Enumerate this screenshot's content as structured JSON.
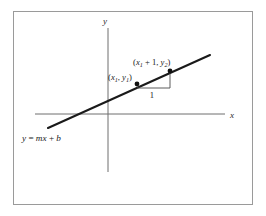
{
  "figure": {
    "background_color": "#ffffff",
    "border_color": "#9a9a9a",
    "ink_color": "#1a1a1a",
    "axis_color": "#6e6e6e"
  },
  "frame": {
    "x": 13,
    "y": 11,
    "width": 240,
    "height": 194
  },
  "axes": {
    "x_axis": {
      "label": "x",
      "x1": 35,
      "y1": 114,
      "x2": 225,
      "y2": 114
    },
    "y_axis": {
      "label": "y",
      "x1": 108,
      "y1": 28,
      "x2": 108,
      "y2": 172
    },
    "x_label_pos": {
      "x": 232,
      "y": 117
    },
    "y_label_pos": {
      "x": 105,
      "y": 24
    }
  },
  "line": {
    "equation_label": "y = mx + b",
    "equation_parts": {
      "y": "y",
      "equals": " = ",
      "m": "m",
      "x": "x",
      "plus": " + ",
      "b": "b"
    },
    "x1": 48,
    "y1": 128,
    "x2": 210,
    "y2": 55,
    "equation_pos": {
      "x": 22,
      "y": 140
    }
  },
  "points": [
    {
      "name": "point-x1-y1",
      "label": "(x₁, y₁)",
      "label_parts": {
        "open": "(",
        "x": "x",
        "xsub": "1",
        "comma": ", ",
        "y": "y",
        "ysub": "1",
        "close": ")"
      },
      "cx": 137,
      "cy": 84,
      "label_x": 108,
      "label_y": 79
    },
    {
      "name": "point-x1-plus-1-y2",
      "label": "(x₁ + 1, y₂)",
      "label_parts": {
        "open": "(",
        "x": "x",
        "xsub": "1",
        "plus": " + 1, ",
        "y": "y",
        "ysub": "2",
        "close": ")"
      },
      "cx": 170,
      "cy": 71,
      "label_x": 133,
      "label_y": 64
    }
  ],
  "slope_triangle": {
    "run_label": "1",
    "run_label_pos": {
      "x": 152,
      "y": 98
    },
    "run_segment": {
      "x1": 137,
      "y1": 88,
      "x2": 170,
      "y2": 88
    },
    "rise_segment": {
      "x1": 170,
      "y1": 71,
      "x2": 170,
      "y2": 88
    }
  }
}
